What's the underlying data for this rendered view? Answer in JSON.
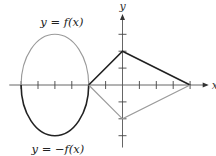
{
  "chart_data": {
    "type": "line",
    "title": "",
    "xlabel": "x",
    "ylabel": "y",
    "xlim": [
      -6.7,
      5.1
    ],
    "ylim": [
      -3.7,
      4.2
    ],
    "x_ticks": [
      -6,
      -5,
      -4,
      -3,
      -2,
      -1,
      1,
      2,
      3,
      4
    ],
    "y_ticks": [
      -3,
      -2,
      -1,
      1,
      2,
      3
    ],
    "tick_labels_shown": false,
    "grid": false,
    "series": [
      {
        "name": "y = f(x)",
        "label": "y = f(x)",
        "shape": "upper-half-ellipse",
        "center": [
          -4,
          0
        ],
        "semi_axes": [
          2,
          3
        ],
        "color": "#9a9a9a"
      },
      {
        "name": "y = -f(x)",
        "label": "y = −f(x)",
        "shape": "lower-half-ellipse",
        "center": [
          -4,
          0
        ],
        "semi_axes": [
          2,
          3
        ],
        "color": "#222222"
      },
      {
        "name": "f polygon",
        "points": [
          [
            -2,
            0
          ],
          [
            0,
            2
          ],
          [
            4,
            0
          ]
        ],
        "color": "#222222"
      },
      {
        "name": "-f polygon",
        "points": [
          [
            -2,
            0
          ],
          [
            0,
            -2
          ],
          [
            4,
            0
          ]
        ],
        "color": "#9a9a9a"
      }
    ],
    "annotations": [
      {
        "text": "y = f(x)",
        "near": "top-left"
      },
      {
        "text": "y = −f(x)",
        "near": "bottom-left"
      }
    ]
  }
}
